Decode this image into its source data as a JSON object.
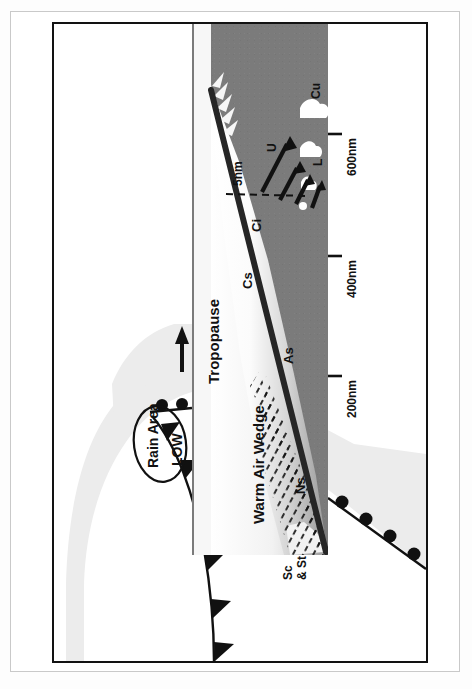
{
  "header": {
    "scan_text": ""
  },
  "figure": {
    "background_color": "#ffffff",
    "band_color": "#7b7b7b",
    "shield_color": "#ececec",
    "ink_color": "#121212"
  },
  "cross_section": {
    "tropopause_label": "Tropopause",
    "warm_air_wedge_label": "Warm Air Wedge",
    "frontal_surface_name": "warm-frontal-surface",
    "clouds": [
      {
        "code": "Ci",
        "name": "cirrus"
      },
      {
        "code": "Cs",
        "name": "cirrostratus"
      },
      {
        "code": "As",
        "name": "altostratus"
      },
      {
        "code": "Ns",
        "name": "nimbostratus"
      },
      {
        "code": "Sc\n& St",
        "name": "stratocumulus-stratus",
        "line1": "Sc",
        "line2": "& St"
      },
      {
        "code": "Cu",
        "name": "cumulus"
      }
    ],
    "height_scale": {
      "label": "5nm",
      "unit": "nm"
    },
    "wind_arrows": [
      {
        "label": "U",
        "name": "upper-wind-arrow"
      },
      {
        "label": "L",
        "name": "lower-wind-arrow"
      }
    ],
    "distance_scale": {
      "ticks": [
        "200nm",
        "400nm",
        "600nm"
      ]
    }
  },
  "surface_map": {
    "rain_area_label": "Rain Area",
    "low_label": "LOW",
    "north_arrow_name": "north-arrow",
    "cold_front_name": "cold-front",
    "warm_front_name": "warm-front",
    "cold_front_barbs": 6,
    "warm_front_bumps": 9
  }
}
